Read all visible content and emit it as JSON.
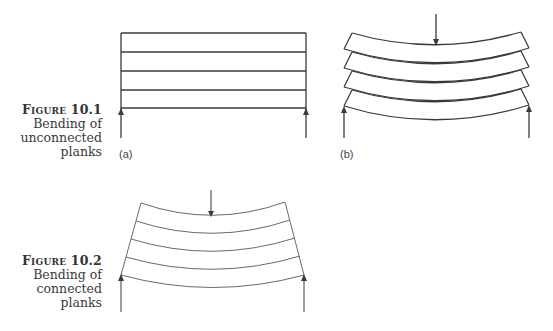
{
  "figures": [
    {
      "id": "10.1",
      "label": "Figure 10.1",
      "caption_lines": [
        "Bending of",
        "unconnected",
        "planks"
      ],
      "panels": [
        {
          "label": "(a)",
          "description": "Stack of five unloaded straight planks with supports at both ends"
        },
        {
          "label": "(b)",
          "description": "Stack of five unconnected planks bending under central load, sliding relative to each other"
        }
      ]
    },
    {
      "id": "10.2",
      "label": "Figure 10.2",
      "caption_lines": [
        "Bending of",
        "connected planks"
      ],
      "description": "Stack of connected planks bending as a single beam under central load"
    }
  ],
  "colors": {
    "line": "#3a3a3a",
    "line_light": "#6a6a6a",
    "caption": "#3a3a3a"
  }
}
